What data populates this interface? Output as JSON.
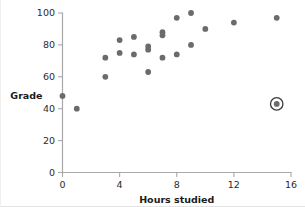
{
  "chart_data": {
    "type": "scatter",
    "title": "",
    "xlabel": "Hours studied",
    "ylabel": "Grade",
    "xlim": [
      0,
      16
    ],
    "ylim": [
      0,
      100
    ],
    "xticks": [
      0,
      4,
      8,
      12,
      16
    ],
    "yticks": [
      0,
      20,
      40,
      60,
      80,
      100
    ],
    "xticklabels": [
      "0",
      "4",
      "8",
      "12",
      "16"
    ],
    "yticklabels": [
      "0",
      "20",
      "40",
      "60",
      "80",
      "100"
    ],
    "grid": false,
    "legend": null,
    "marker_color": "#6b6b6b",
    "axis_color": "#a9a9a9",
    "highlight_color": "#3a3a3a",
    "points": [
      {
        "x": 0,
        "y": 48
      },
      {
        "x": 1,
        "y": 40
      },
      {
        "x": 3,
        "y": 72
      },
      {
        "x": 3,
        "y": 60
      },
      {
        "x": 4,
        "y": 83
      },
      {
        "x": 4,
        "y": 75
      },
      {
        "x": 5,
        "y": 85
      },
      {
        "x": 5,
        "y": 74
      },
      {
        "x": 6,
        "y": 79
      },
      {
        "x": 6,
        "y": 77
      },
      {
        "x": 6,
        "y": 63
      },
      {
        "x": 7,
        "y": 88
      },
      {
        "x": 7,
        "y": 86
      },
      {
        "x": 7,
        "y": 72
      },
      {
        "x": 8,
        "y": 97
      },
      {
        "x": 8,
        "y": 74
      },
      {
        "x": 9,
        "y": 100
      },
      {
        "x": 9,
        "y": 80
      },
      {
        "x": 10,
        "y": 90
      },
      {
        "x": 12,
        "y": 94
      },
      {
        "x": 15,
        "y": 97
      },
      {
        "x": 15,
        "y": 43
      }
    ],
    "highlighted_points": [
      {
        "x": 15,
        "y": 43
      }
    ]
  }
}
